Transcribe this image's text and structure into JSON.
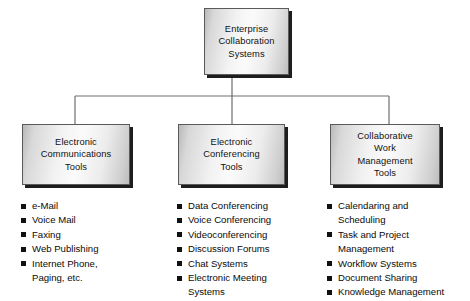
{
  "diagram": {
    "title": "Enterprise Collaboration Systems",
    "type": "hierarchy-tree",
    "root": {
      "label": "Enterprise\nCollaboration\nSystems"
    },
    "branches": [
      {
        "box_label": "Electronic\nCommunications\nTools",
        "items": [
          "e-Mail",
          "Voice Mail",
          "Faxing",
          "Web Publishing",
          "Internet Phone,\nPaging, etc."
        ]
      },
      {
        "box_label": "Electronic\nConferencing\nTools",
        "items": [
          "Data Conferencing",
          "Voice Conferencing",
          "Videoconferencing",
          "Discussion Forums",
          "Chat Systems",
          "Electronic Meeting\nSystems"
        ]
      },
      {
        "box_label": "Collaborative\nWork\nManagement\nTools",
        "items": [
          "Calendaring and\nScheduling",
          "Task and Project\nManagement",
          "Workflow Systems",
          "Document Sharing",
          "Knowledge Management"
        ]
      }
    ],
    "colors": {
      "background": "#ffffff",
      "box_border": "#5a5a5a",
      "box_shadow": "#1d1d1d",
      "connector_line": "#6e6e6e",
      "text": "#111111",
      "bullet_marker": "#111111"
    }
  }
}
